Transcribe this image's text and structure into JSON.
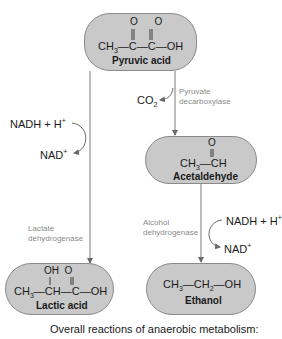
{
  "nodes": {
    "pyruvic": {
      "name": "Pyruvic acid",
      "formula_main": "CH3—C—C—OH",
      "formula_top": "O   O"
    },
    "acetaldehyde": {
      "name": "Acetaldehyde",
      "formula_main": "CH3—CH",
      "formula_top": "O"
    },
    "lactic": {
      "name": "Lactic acid",
      "formula_main": "CH3—CH—C—OH",
      "formula_top": "OH  O"
    },
    "ethanol": {
      "name": "Ethanol",
      "formula_main": "CH3—CH2—OH"
    }
  },
  "enzymes": {
    "pyruvate_decarboxylase": "Pyruvate\ndecarboxylase",
    "lactate_dehydrogenase": "Lactate\ndehydrogenase",
    "alcohol_dehydrogenase": "Alcohol\ndehydrogenase"
  },
  "cofactors": {
    "co2": "CO",
    "co2_sub": "2",
    "nadh_left": "NADH + H",
    "nadh_left_sup": "+",
    "nad_left": "NAD",
    "nad_left_sup": "+",
    "nadh_right": "NADH + H",
    "nadh_right_sup": "+",
    "nad_right": "NAD",
    "nad_right_sup": "+"
  },
  "caption": "Overall reactions of anaerobic metabolism:",
  "colors": {
    "box_fill": "#c9c9c9",
    "box_border": "#8a8a8a",
    "enzyme_text": "#8a8a8a",
    "arrow": "#7a7a7a"
  }
}
